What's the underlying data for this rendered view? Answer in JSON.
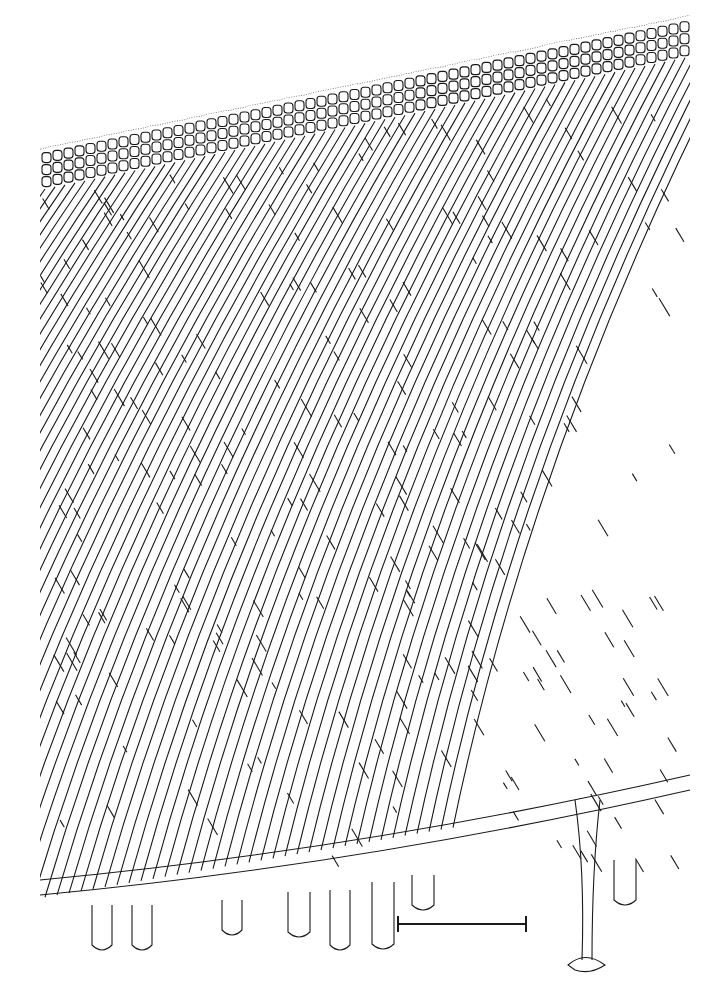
{
  "figure": {
    "type": "botanical line drawing",
    "background": "#ffffff",
    "ink": "#1a1a1a"
  },
  "scale_bar": {
    "x1": 398,
    "x2": 526,
    "y": 924,
    "label": ""
  }
}
